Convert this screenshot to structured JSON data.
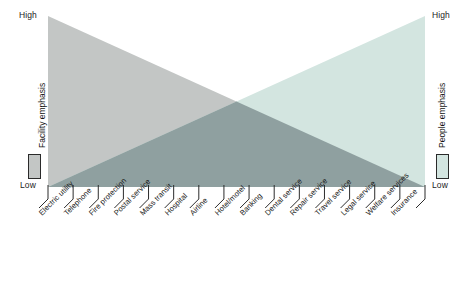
{
  "figure": {
    "type": "dual-triangle-continuum",
    "left_axis": {
      "title": "Facility emphasis",
      "high_label": "High",
      "low_label": "Low",
      "swatch_color": "#c3c6c5",
      "swatch_name": "facility-emphasis-swatch"
    },
    "right_axis": {
      "title": "People emphasis",
      "high_label": "High",
      "low_label": "Low",
      "swatch_color": "#d3e5e0",
      "swatch_name": "people-emphasis-swatch"
    }
  },
  "colors": {
    "facility_fill": "#c3c6c5",
    "people_fill": "#d3e5e0",
    "overlap_fill": "#8fa0a0",
    "leader_line": "#2b2b2b",
    "text": "#171717"
  },
  "chart_data": {
    "type": "area",
    "title": "",
    "xlabel": "",
    "ylabel": "",
    "ylim": [
      0,
      100
    ],
    "ytick_labels": [
      "Low",
      "High"
    ],
    "grid": false,
    "legend_position": "axis-titles",
    "categories": [
      "Electric utility",
      "Telephone",
      "Fire protection",
      "Postal service",
      "Mass transit",
      "Hospital",
      "Airline",
      "Hotel/motel",
      "Banking",
      "Dental service",
      "Repair service",
      "Travel service",
      "Legal service",
      "Welfare services",
      "Insurance"
    ],
    "series": [
      {
        "name": "Facility emphasis",
        "color": "#c3c6c5",
        "values": [
          100,
          93,
          86,
          79,
          71,
          64,
          57,
          50,
          43,
          36,
          29,
          21,
          14,
          7,
          0
        ]
      },
      {
        "name": "People emphasis",
        "color": "#d3e5e0",
        "values": [
          0,
          7,
          14,
          21,
          29,
          36,
          43,
          50,
          57,
          64,
          71,
          79,
          86,
          93,
          100
        ]
      }
    ],
    "tick_count": 16,
    "annotations": []
  }
}
